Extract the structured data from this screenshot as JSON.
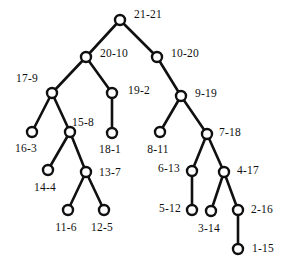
{
  "figure": {
    "kind": "rooted-binary-tree-diagram",
    "width": 289,
    "height": 270,
    "background_color": "#ffffff",
    "stroke_color": "#101010",
    "node_fill_color": "#ffffff",
    "label_separator": "-"
  },
  "nodes": [
    {
      "id": "n21",
      "label": "21-21",
      "cx": 120,
      "cy": 20,
      "r": 5.0,
      "label_x": 148,
      "label_y": 15
    },
    {
      "id": "n20",
      "label": "20-10",
      "cx": 86,
      "cy": 57,
      "r": 5.0,
      "label_x": 114,
      "label_y": 54
    },
    {
      "id": "n10",
      "label": "10-20",
      "cx": 157,
      "cy": 57,
      "r": 5.0,
      "label_x": 185,
      "label_y": 54
    },
    {
      "id": "n17",
      "label": "17-9",
      "cx": 52,
      "cy": 93,
      "r": 5.0,
      "label_x": 27,
      "label_y": 79
    },
    {
      "id": "n19",
      "label": "19-2",
      "cx": 112,
      "cy": 93,
      "r": 5.0,
      "label_x": 139,
      "label_y": 91
    },
    {
      "id": "n9",
      "label": "9-19",
      "cx": 181,
      "cy": 96,
      "r": 5.0,
      "label_x": 206,
      "label_y": 94
    },
    {
      "id": "n16",
      "label": "16-3",
      "cx": 32,
      "cy": 132,
      "r": 5.0,
      "label_x": 26,
      "label_y": 149
    },
    {
      "id": "n15",
      "label": "15-8",
      "cx": 70,
      "cy": 132,
      "r": 5.0,
      "label_x": 83,
      "label_y": 123
    },
    {
      "id": "n18",
      "label": "18-1",
      "cx": 112,
      "cy": 133,
      "r": 5.0,
      "label_x": 110,
      "label_y": 150
    },
    {
      "id": "n8",
      "label": "8-11",
      "cx": 160,
      "cy": 132,
      "r": 5.0,
      "label_x": 158,
      "label_y": 150
    },
    {
      "id": "n7",
      "label": "7-18",
      "cx": 207,
      "cy": 134,
      "r": 5.0,
      "label_x": 230,
      "label_y": 133
    },
    {
      "id": "n14",
      "label": "14-4",
      "cx": 48,
      "cy": 170,
      "r": 5.0,
      "label_x": 45,
      "label_y": 188
    },
    {
      "id": "n13",
      "label": "13-7",
      "cx": 86,
      "cy": 172,
      "r": 5.0,
      "label_x": 110,
      "label_y": 173
    },
    {
      "id": "n6",
      "label": "6-13",
      "cx": 192,
      "cy": 171,
      "r": 5.0,
      "label_x": 169,
      "label_y": 169
    },
    {
      "id": "n4",
      "label": "4-17",
      "cx": 224,
      "cy": 172,
      "r": 5.0,
      "label_x": 248,
      "label_y": 171
    },
    {
      "id": "n11",
      "label": "11-6",
      "cx": 68,
      "cy": 210,
      "r": 5.0,
      "label_x": 66,
      "label_y": 228
    },
    {
      "id": "n12",
      "label": "12-5",
      "cx": 104,
      "cy": 210,
      "r": 5.0,
      "label_x": 102,
      "label_y": 228
    },
    {
      "id": "n5",
      "label": "5-12",
      "cx": 192,
      "cy": 210,
      "r": 5.0,
      "label_x": 170,
      "label_y": 209
    },
    {
      "id": "n3",
      "label": "3-14",
      "cx": 211,
      "cy": 211,
      "r": 5.0,
      "label_x": 209,
      "label_y": 229
    },
    {
      "id": "n2",
      "label": "2-16",
      "cx": 238,
      "cy": 210,
      "r": 5.0,
      "label_x": 262,
      "label_y": 210
    },
    {
      "id": "n1",
      "label": "1-15",
      "cx": 238,
      "cy": 249,
      "r": 5.0,
      "label_x": 263,
      "label_y": 249
    }
  ],
  "edges": [
    {
      "from": "n21",
      "to": "n20",
      "x1": 120,
      "y1": 20,
      "x2": 86,
      "y2": 57
    },
    {
      "from": "n21",
      "to": "n10",
      "x1": 120,
      "y1": 20,
      "x2": 157,
      "y2": 57
    },
    {
      "from": "n20",
      "to": "n17",
      "x1": 86,
      "y1": 57,
      "x2": 52,
      "y2": 93
    },
    {
      "from": "n20",
      "to": "n19",
      "x1": 86,
      "y1": 57,
      "x2": 112,
      "y2": 93
    },
    {
      "from": "n10",
      "to": "n9",
      "x1": 157,
      "y1": 57,
      "x2": 181,
      "y2": 96
    },
    {
      "from": "n17",
      "to": "n16",
      "x1": 52,
      "y1": 93,
      "x2": 32,
      "y2": 132
    },
    {
      "from": "n17",
      "to": "n15",
      "x1": 52,
      "y1": 93,
      "x2": 70,
      "y2": 132
    },
    {
      "from": "n19",
      "to": "n18",
      "x1": 112,
      "y1": 93,
      "x2": 112,
      "y2": 133
    },
    {
      "from": "n9",
      "to": "n8",
      "x1": 181,
      "y1": 96,
      "x2": 160,
      "y2": 132
    },
    {
      "from": "n9",
      "to": "n7",
      "x1": 181,
      "y1": 96,
      "x2": 207,
      "y2": 134
    },
    {
      "from": "n15",
      "to": "n14",
      "x1": 70,
      "y1": 132,
      "x2": 48,
      "y2": 170
    },
    {
      "from": "n15",
      "to": "n13",
      "x1": 70,
      "y1": 132,
      "x2": 86,
      "y2": 172
    },
    {
      "from": "n7",
      "to": "n6",
      "x1": 207,
      "y1": 134,
      "x2": 192,
      "y2": 171
    },
    {
      "from": "n7",
      "to": "n4",
      "x1": 207,
      "y1": 134,
      "x2": 224,
      "y2": 172
    },
    {
      "from": "n13",
      "to": "n11",
      "x1": 86,
      "y1": 172,
      "x2": 68,
      "y2": 210
    },
    {
      "from": "n13",
      "to": "n12",
      "x1": 86,
      "y1": 172,
      "x2": 104,
      "y2": 210
    },
    {
      "from": "n6",
      "to": "n5",
      "x1": 192,
      "y1": 171,
      "x2": 192,
      "y2": 210
    },
    {
      "from": "n4",
      "to": "n3",
      "x1": 224,
      "y1": 172,
      "x2": 211,
      "y2": 211
    },
    {
      "from": "n4",
      "to": "n2",
      "x1": 224,
      "y1": 172,
      "x2": 238,
      "y2": 210
    },
    {
      "from": "n2",
      "to": "n1",
      "x1": 238,
      "y1": 210,
      "x2": 238,
      "y2": 249
    }
  ]
}
